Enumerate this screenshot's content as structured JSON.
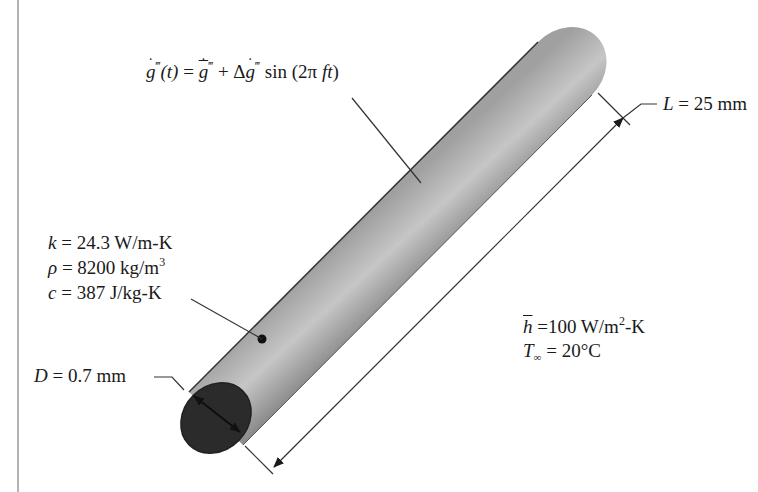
{
  "figure": {
    "type": "heat-transfer-diagram",
    "colors": {
      "rod_body": "#a9a9a9",
      "rod_body_light": "#c8c8c8",
      "rod_end_face": "#2b2b2b",
      "line": "#222222",
      "frame_line": "#9a9a9a"
    }
  },
  "labels": {
    "generation": {
      "lhs": "g",
      "lhs_sup": "‴",
      "lhs_arg": "(t)",
      "equals": " = ",
      "mean": "g",
      "mean_sup": "‴",
      "plus": " + Δ",
      "amp": "g",
      "amp_sup": "‴",
      "func": " sin (2π ",
      "func_arg": "ft",
      "close": ")"
    },
    "length": {
      "symbol": "L",
      "value": " = 25 mm"
    },
    "properties": [
      {
        "symbol": "k",
        "value": " = 24.3 W/m-K"
      },
      {
        "symbol": "ρ",
        "value": " = 8200 kg/m",
        "sup": "3"
      },
      {
        "symbol": "c",
        "value": " = 387 J/kg-K"
      }
    ],
    "convection": {
      "h_symbol": "h",
      "h_value": " =100 W/m",
      "h_sup": "2",
      "h_unit": "-K",
      "t_symbol": "T",
      "t_sub": "∞",
      "t_value": " = 20°C"
    },
    "diameter": {
      "symbol": "D",
      "value": " = 0.7 mm"
    }
  }
}
